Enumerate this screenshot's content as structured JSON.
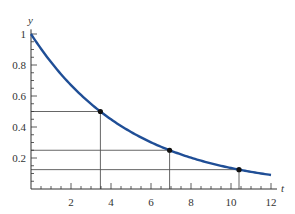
{
  "chart_data": {
    "type": "line",
    "title": "",
    "xlabel": "t",
    "ylabel": "y",
    "xlim": [
      0,
      12
    ],
    "ylim": [
      0,
      1
    ],
    "grid": false,
    "x_ticks": [
      2,
      4,
      6,
      8,
      10,
      12
    ],
    "y_ticks": [
      0.2,
      0.4,
      0.6,
      0.8,
      1
    ],
    "x_tick_labels": [
      "2",
      "4",
      "6",
      "8",
      "10",
      "12"
    ],
    "y_tick_labels": [
      "0.2",
      "0.4",
      "0.6",
      "0.8",
      "1"
    ],
    "series": [
      {
        "name": "y = e^(-0.2t)",
        "color": "#1f4e96",
        "function": "exp(-0.2*t)",
        "x": [
          0,
          1,
          2,
          3,
          4,
          5,
          6,
          7,
          8,
          9,
          10,
          11,
          12
        ],
        "values": [
          1.0,
          0.819,
          0.67,
          0.549,
          0.449,
          0.368,
          0.301,
          0.247,
          0.202,
          0.165,
          0.135,
          0.111,
          0.091
        ]
      }
    ],
    "marked_points": [
      {
        "t": 3.47,
        "y": 0.5
      },
      {
        "t": 6.93,
        "y": 0.25
      },
      {
        "t": 10.4,
        "y": 0.125
      }
    ],
    "guide_lines": "horizontal and vertical lines from each marked point to the axes"
  },
  "labels": {
    "x_axis": "t",
    "y_axis": "y",
    "x_ticks": [
      "2",
      "4",
      "6",
      "8",
      "10",
      "12"
    ],
    "y_ticks": [
      "0.2",
      "0.4",
      "0.6",
      "0.8",
      "1"
    ]
  }
}
